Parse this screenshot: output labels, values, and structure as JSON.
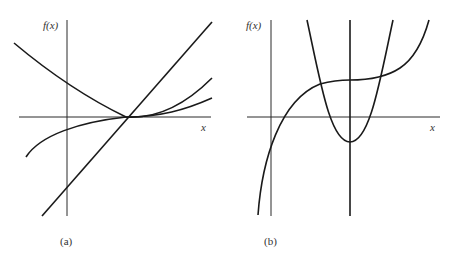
{
  "panels": [
    {
      "id": "a",
      "caption": "(a)",
      "y_label": "f(x)",
      "x_label": "x",
      "description": "Line, parabola, and cubic all passing through the same point on the x-axis",
      "curves": [
        "straight-line",
        "parabola-tangent-at-root",
        "cubic-inflection-at-root"
      ]
    },
    {
      "id": "b",
      "caption": "(b)",
      "y_label": "f(x)",
      "x_label": "x",
      "description": "Cubic with horizontal inflection, parabola with minimum below axis, and vertical line through both",
      "curves": [
        "cubic",
        "parabola",
        "vertical-line"
      ]
    }
  ],
  "colors": {
    "ink": "#1a1a1a",
    "background": "#ffffff"
  }
}
